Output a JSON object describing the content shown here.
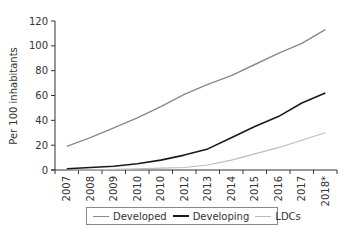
{
  "chart_data": {
    "type": "line",
    "title": "",
    "xlabel": "",
    "ylabel": "Per 100 inhabitants",
    "ylim": [
      0,
      120
    ],
    "yticks": [
      0,
      20,
      40,
      60,
      80,
      100,
      120
    ],
    "categories": [
      "2007",
      "2008",
      "2009",
      "2010",
      "2010",
      "2012",
      "2013",
      "2014",
      "2015",
      "2016",
      "2017",
      "2018*"
    ],
    "grid": false,
    "legend_position": "bottom",
    "series": [
      {
        "name": "Developed",
        "color": "#8a8a8a",
        "width": 1.4,
        "values": [
          19,
          26,
          34,
          42,
          51,
          61,
          69,
          76,
          85,
          94,
          102,
          113
        ]
      },
      {
        "name": "Developing",
        "color": "#1a1a1a",
        "width": 1.6,
        "values": [
          1,
          2,
          3,
          5,
          8,
          12,
          17,
          26,
          35,
          43,
          54,
          62
        ]
      },
      {
        "name": "LDCs",
        "color": "#bdbdbd",
        "width": 1.2,
        "values": [
          0,
          0,
          0.5,
          1,
          1.5,
          2,
          4,
          8,
          13,
          18,
          24,
          30
        ]
      }
    ]
  },
  "legend": {
    "items": [
      {
        "label": "Developed",
        "color": "#8a8a8a"
      },
      {
        "label": "Developing",
        "color": "#1a1a1a"
      },
      {
        "label": "LDCs",
        "color": "#bdbdbd"
      }
    ]
  }
}
